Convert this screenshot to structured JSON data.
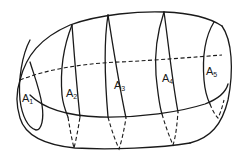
{
  "diagram": {
    "title": "",
    "stroke_color": "#1a1a1a",
    "background_color": "#ffffff",
    "regions": [
      {
        "id": "A1",
        "base": "A",
        "sub": "1"
      },
      {
        "id": "A2",
        "base": "A",
        "sub": "2"
      },
      {
        "id": "A3",
        "base": "A",
        "sub": "3"
      },
      {
        "id": "A4",
        "base": "A",
        "sub": "4"
      },
      {
        "id": "A5",
        "base": "A",
        "sub": "5"
      }
    ]
  }
}
